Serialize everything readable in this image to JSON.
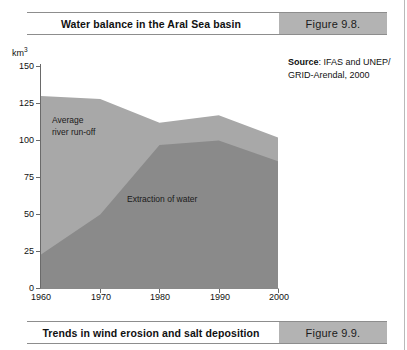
{
  "figure_top": {
    "title": "Water balance in the Aral Sea basin",
    "number": "Figure 9.8."
  },
  "figure_bottom": {
    "title": "Trends in wind erosion and salt deposition",
    "number": "Figure 9.9."
  },
  "source": {
    "label": "Source",
    "text": ": IFAS and UNEP/ GRID-Arendal, 2000"
  },
  "chart_data": {
    "type": "area",
    "title": "Water balance in the Aral Sea basin",
    "xlabel": "",
    "ylabel": "km³",
    "unit": "km",
    "unit_sup": "3",
    "x": [
      1960,
      1970,
      1980,
      1990,
      2000
    ],
    "xticks": [
      "1960",
      "1970",
      "1980",
      "1990",
      "2000"
    ],
    "yticks": [
      "0",
      "25",
      "50",
      "75",
      "100",
      "125",
      "150"
    ],
    "ylim": [
      0,
      150
    ],
    "xlim": [
      1960,
      2000
    ],
    "grid": false,
    "legend": "in-plot labels",
    "stacked": false,
    "series": [
      {
        "name": "Average river run-off",
        "label_text": "Average\nriver run-off",
        "color": "#a8a8a8",
        "values": [
          130,
          128,
          112,
          117,
          102
        ]
      },
      {
        "name": "Extraction of water",
        "label_text": "Extraction of water",
        "color": "#8a8a8a",
        "values": [
          23,
          50,
          97,
          100,
          86
        ]
      }
    ]
  },
  "colors": {
    "runoff": "#a8a8a8",
    "extraction": "#8a8a8a",
    "caption_number_bg": "#b3b3b3",
    "axis": "#6a6a6a"
  }
}
